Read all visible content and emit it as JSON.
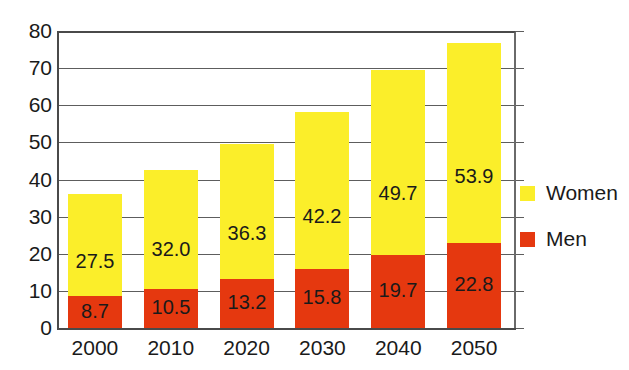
{
  "chart_data": {
    "type": "bar",
    "subtype": "stacked-bar",
    "title": "",
    "subtitle": "",
    "xlabel": "",
    "ylabel": "",
    "categories": [
      "2000",
      "2010",
      "2020",
      "2030",
      "2040",
      "2050"
    ],
    "series": [
      {
        "name": "Men",
        "color": "#e5380f",
        "values": [
          8.7,
          10.5,
          13.2,
          15.8,
          19.7,
          22.8
        ],
        "labels": [
          "8.7",
          "10.5",
          "13.2",
          "15.8",
          "19.7",
          "22.8"
        ]
      },
      {
        "name": "Women",
        "color": "#fbee2a",
        "values": [
          27.5,
          32.0,
          36.3,
          42.2,
          49.7,
          53.9
        ],
        "labels": [
          "27.5",
          "32.0",
          "36.3",
          "42.2",
          "49.7",
          "53.9"
        ]
      }
    ],
    "totals": [
      36.2,
      42.5,
      49.5,
      58.0,
      69.4,
      76.7
    ],
    "ylim": [
      0,
      80
    ],
    "yticks": [
      0,
      10,
      20,
      30,
      40,
      50,
      60,
      70,
      80
    ],
    "ytick_labels": [
      "0",
      "10",
      "20",
      "30",
      "40",
      "50",
      "60",
      "70",
      "80"
    ],
    "grid": true,
    "grid_axis": "y",
    "legend_position": "right",
    "legend": [
      {
        "label": "Women",
        "color": "#fbee2a"
      },
      {
        "label": "Men",
        "color": "#e5380f"
      }
    ],
    "background_color": "#ffffff",
    "axis_color": "#4a4a4a",
    "grid_color": "#5d5d5d",
    "text_color": "#1a1a1a"
  }
}
